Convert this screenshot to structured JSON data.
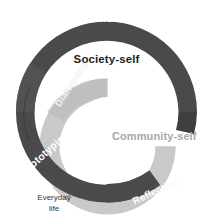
{
  "diagram": {
    "type": "concentric-spiral-diagram",
    "colors": {
      "outer_ring": "#4a4a4a",
      "inner_ring": "#c9c9c9",
      "background": "#ffffff",
      "light_label_text": "#ffffff",
      "dark_label_text": "#232323",
      "gray_label_text": "#a8a8a8",
      "annotation_text": "#333333",
      "leader_line": "#555555"
    },
    "labels": {
      "role_constructing": "Role-constructing",
      "society_self": "Society-self",
      "community_self": "Community-self",
      "dialoguing": "Dialoguing",
      "prototyping": "Prototyping",
      "reflecting": "Reflecting",
      "everyday_life_line1": "Everyday",
      "everyday_life_line2": "life"
    }
  }
}
